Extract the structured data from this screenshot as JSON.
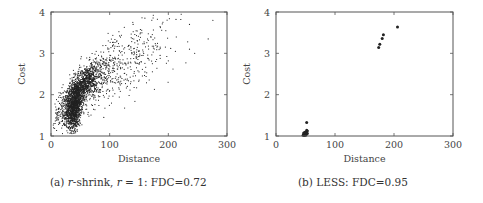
{
  "chart_data": [
    {
      "type": "scatter",
      "id": "a",
      "caption": {
        "prefix": "(a) ",
        "method_italic": "r",
        "method_rest": "-shrink, ",
        "param_italic": "r",
        "param_rest": " = 1: FDC=0.72"
      },
      "xlabel": "Distance",
      "ylabel": "Cost",
      "xlim": [
        0,
        300
      ],
      "ylim": [
        1,
        4
      ],
      "xticks": [
        0,
        100,
        200,
        300
      ],
      "yticks": [
        1,
        2,
        3,
        4
      ],
      "grid": false,
      "fdc": 0.72,
      "point_count_approx": 3000,
      "distribution": [
        {
          "cx": 40,
          "cy": 1.75,
          "sx": 7,
          "sy": 0.3,
          "n": 1400
        },
        {
          "cx": 60,
          "cy": 2.3,
          "sx": 10,
          "sy": 0.2,
          "n": 700
        },
        {
          "cx": 25,
          "cy": 1.7,
          "sx": 10,
          "sy": 0.25,
          "n": 250
        },
        {
          "cx": 90,
          "cy": 2.5,
          "sx": 25,
          "sy": 0.35,
          "n": 350
        },
        {
          "cx": 150,
          "cy": 2.9,
          "sx": 30,
          "sy": 0.35,
          "n": 200
        }
      ],
      "points": [
        [
          160,
          3.85
        ],
        [
          213,
          3.82
        ],
        [
          236,
          3.7
        ],
        [
          276,
          3.8
        ],
        [
          268,
          3.35
        ],
        [
          233,
          3.28
        ],
        [
          236,
          3.1
        ],
        [
          204,
          3.12
        ],
        [
          212,
          3.05
        ],
        [
          200,
          2.82
        ],
        [
          208,
          2.62
        ],
        [
          230,
          2.77
        ],
        [
          186,
          2.95
        ],
        [
          150,
          3.05
        ],
        [
          125,
          3.63
        ],
        [
          140,
          3.7
        ],
        [
          170,
          3.4
        ],
        [
          160,
          2.55
        ],
        [
          140,
          2.45
        ],
        [
          118,
          2.45
        ],
        [
          100,
          2.1
        ],
        [
          130,
          2.2
        ],
        [
          90,
          1.45
        ],
        [
          30,
          1.3
        ],
        [
          5,
          1.3
        ],
        [
          10,
          1.45
        ],
        [
          45,
          1.15
        ],
        [
          180,
          2.85
        ],
        [
          195,
          3.15
        ],
        [
          245,
          3.0
        ]
      ]
    },
    {
      "type": "scatter",
      "id": "b",
      "caption": {
        "prefix": "(b) ",
        "text": "LESS: FDC=0.95"
      },
      "xlabel": "Distance",
      "ylabel": "Cost",
      "xlim": [
        0,
        300
      ],
      "ylim": [
        1,
        4
      ],
      "xticks": [
        0,
        100,
        200,
        300
      ],
      "yticks": [
        1,
        2,
        3,
        4
      ],
      "grid": false,
      "fdc": 0.95,
      "points": [
        [
          206,
          3.64
        ],
        [
          182,
          3.45
        ],
        [
          180,
          3.36
        ],
        [
          176,
          3.22
        ],
        [
          174,
          3.14
        ],
        [
          52,
          1.33
        ],
        [
          46,
          1.02
        ],
        [
          47,
          1.04
        ],
        [
          48,
          1.03
        ],
        [
          49,
          1.06
        ],
        [
          50,
          1.05
        ],
        [
          51,
          1.08
        ],
        [
          52,
          1.1
        ],
        [
          53,
          1.12
        ],
        [
          52,
          1.14
        ],
        [
          50,
          1.02
        ],
        [
          48,
          1.01
        ],
        [
          49,
          1.09
        ],
        [
          51,
          1.03
        ],
        [
          53,
          1.06
        ],
        [
          47,
          1.07
        ]
      ]
    }
  ]
}
